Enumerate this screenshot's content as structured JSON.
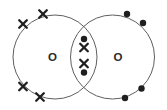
{
  "diagram": {
    "type": "dot-and-cross",
    "molecule": "oxygen molecule (double covalent bond)",
    "colors": {
      "background": "#ffffff",
      "circle_outline": "#5f5f5f",
      "electron": "#1f1f1f",
      "label": "#2a2a2a"
    },
    "atoms": [
      {
        "label": "O",
        "cx": 55,
        "cy": 57,
        "r": 42,
        "label_x": 52.5,
        "label_y": 56.5,
        "electron_symbol": "cross"
      },
      {
        "label": "O",
        "cx": 112.5,
        "cy": 57,
        "r": 42,
        "label_x": 118,
        "label_y": 56.5,
        "electron_symbol": "dot"
      }
    ],
    "outer_electrons": [
      {
        "type": "cross",
        "x": 23,
        "y": 24
      },
      {
        "type": "cross",
        "x": 43,
        "y": 14
      },
      {
        "type": "cross",
        "x": 23,
        "y": 86.5
      },
      {
        "type": "cross",
        "x": 40,
        "y": 97
      },
      {
        "type": "dot",
        "x": 127,
        "y": 14
      },
      {
        "type": "dot",
        "x": 143,
        "y": 23
      },
      {
        "type": "dot",
        "x": 125,
        "y": 98
      },
      {
        "type": "dot",
        "x": 141.5,
        "y": 88.5
      }
    ],
    "shared_electrons": [
      {
        "type": "dot",
        "x": 84,
        "y": 39
      },
      {
        "type": "cross",
        "x": 84,
        "y": 47.5
      },
      {
        "type": "cross",
        "x": 84,
        "y": 63.5
      },
      {
        "type": "dot",
        "x": 84,
        "y": 72.5
      }
    ]
  }
}
